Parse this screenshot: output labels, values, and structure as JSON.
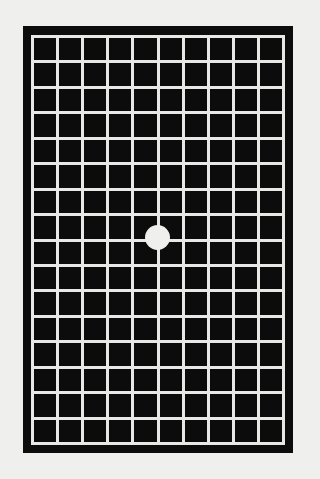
{
  "figure": {
    "type": "amsler-grid",
    "columns": 10,
    "rows": 16,
    "colors": {
      "background": "#efefed",
      "frame": "#0c0c0c",
      "grid_lines": "#e8e8e6",
      "center_dot": "#efefed"
    },
    "center_dot": true
  }
}
